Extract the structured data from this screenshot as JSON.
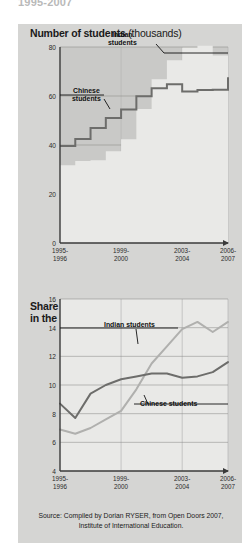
{
  "cut_title": "1995-2007",
  "side_credit": "Sciences Po / CERI et Atelier de cartographie, February 2008",
  "figure1": {
    "title_main": "Number of students",
    "title_unit": "(thousands)",
    "label_indian": "Indian\nstudents",
    "label_indian_line1": "Indian",
    "label_indian_line2": "students",
    "label_chinese_line1": "Chinese",
    "label_chinese_line2": "students"
  },
  "figure2": {
    "title_line1": "Share of foreign students",
    "title_line2": "in the United States",
    "title_unit": "(%)",
    "label_indian": "Indian students",
    "label_chinese": "Chinese students"
  },
  "source": {
    "line1": "Source: Compiled by Dorian RYSER, from Open Doors 2007,",
    "line2": "Institute of International Education."
  },
  "colors": {
    "panel": "#d5d5d3",
    "plot_dark": "#c9c9c7",
    "plot_light": "#e9e9e7",
    "chinese_line": "#6d6d6b",
    "indian_line": "#b0b0ae",
    "grid": "#8a8a88",
    "axis": "#3a3a3a"
  },
  "chart_data": [
    {
      "type": "area",
      "title": "Number of students (thousands)",
      "xlabel": "",
      "ylabel": "thousands",
      "ylim": [
        0,
        80
      ],
      "yticks": [
        0,
        20,
        40,
        60,
        80
      ],
      "grid": true,
      "legend": "annotated-inline",
      "x": [
        "1995-1996",
        "1996-1997",
        "1997-1998",
        "1998-1999",
        "1999-2000",
        "2000-2001",
        "2001-2002",
        "2002-2003",
        "2003-2004",
        "2004-2005",
        "2005-2006",
        "2006-2007"
      ],
      "xtick_labels": [
        "1995-1996",
        "1999-2000",
        "2003-2004",
        "2006-2007"
      ],
      "xtick_positions": [
        0,
        4,
        8,
        11
      ],
      "series": [
        {
          "name": "Chinese students",
          "color": "#6d6d6b",
          "style": "step",
          "values": [
            39.6,
            42.5,
            46.9,
            51.0,
            54.5,
            59.9,
            63.2,
            64.8,
            61.8,
            62.5,
            62.6,
            67.7
          ]
        },
        {
          "name": "Indian students",
          "color": "#b0b0ae",
          "style": "step-area",
          "values": [
            31.7,
            33.5,
            33.8,
            37.5,
            42.3,
            54.7,
            66.8,
            74.6,
            79.7,
            80.5,
            76.5,
            83.8
          ]
        }
      ]
    },
    {
      "type": "line",
      "title": "Share of foreign students in the United States (%)",
      "xlabel": "",
      "ylabel": "%",
      "ylim": [
        4,
        16
      ],
      "yticks": [
        4,
        6,
        8,
        10,
        12,
        14,
        16
      ],
      "grid": true,
      "legend": "annotated-inline",
      "x": [
        "1995-1996",
        "1996-1997",
        "1997-1998",
        "1998-1999",
        "1999-2000",
        "2000-2001",
        "2001-2002",
        "2002-2003",
        "2003-2004",
        "2004-2005",
        "2005-2006",
        "2006-2007"
      ],
      "xtick_labels": [
        "1995-1996",
        "1999-2000",
        "2003-2004",
        "2006-2007"
      ],
      "xtick_positions": [
        0,
        4,
        8,
        11
      ],
      "series": [
        {
          "name": "Chinese students",
          "color": "#6d6d6b",
          "values": [
            8.7,
            7.7,
            9.4,
            10.0,
            10.4,
            10.6,
            10.8,
            10.8,
            10.5,
            10.6,
            10.9,
            11.6
          ]
        },
        {
          "name": "Indian students",
          "color": "#b0b0ae",
          "values": [
            6.9,
            6.6,
            7.0,
            7.6,
            8.2,
            9.7,
            11.5,
            12.7,
            13.9,
            14.4,
            13.7,
            14.4
          ]
        }
      ]
    }
  ]
}
